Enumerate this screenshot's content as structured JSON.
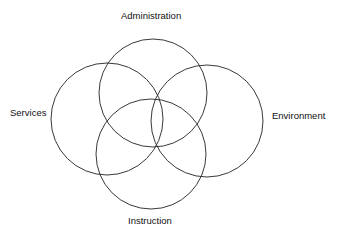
{
  "diagram": {
    "type": "venn",
    "sets": [
      {
        "id": "administration",
        "label": "Administration",
        "cx": 153,
        "cy": 93,
        "r": 54
      },
      {
        "id": "services",
        "label": "Services",
        "cx": 107,
        "cy": 119,
        "r": 56
      },
      {
        "id": "environment",
        "label": "Environment",
        "cx": 207,
        "cy": 121,
        "r": 56
      },
      {
        "id": "instruction",
        "label": "Instruction",
        "cx": 151,
        "cy": 154,
        "r": 55
      }
    ],
    "stroke_color": "#222222",
    "background": "#ffffff"
  }
}
